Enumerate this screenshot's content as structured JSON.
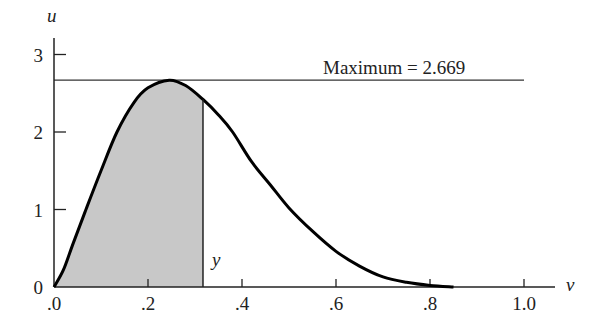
{
  "chart_data": {
    "type": "area",
    "title": "",
    "xlabel": "v",
    "ylabel": "u",
    "xlim": [
      0,
      1.06
    ],
    "ylim": [
      0,
      3.15
    ],
    "x_ticks": [
      0.0,
      0.2,
      0.4,
      0.6,
      0.8,
      1.0
    ],
    "x_tick_labels": [
      ".0",
      ".2",
      ".4",
      ".6",
      ".8",
      "1.0"
    ],
    "y_ticks": [
      0,
      1,
      2,
      3
    ],
    "y_tick_labels": [
      "0",
      "1",
      "2",
      "3"
    ],
    "grid": false,
    "legend": null,
    "series": [
      {
        "name": "density",
        "x": [
          0,
          0.02,
          0.04,
          0.068,
          0.1,
          0.134,
          0.17,
          0.2,
          0.245,
          0.28,
          0.317,
          0.35,
          0.38,
          0.42,
          0.46,
          0.5,
          0.55,
          0.6,
          0.65,
          0.7,
          0.75,
          0.8,
          0.85
        ],
        "y": [
          0,
          0.22,
          0.55,
          1.0,
          1.5,
          2.0,
          2.38,
          2.57,
          2.669,
          2.6,
          2.42,
          2.22,
          2.0,
          1.62,
          1.32,
          1.02,
          0.72,
          0.46,
          0.27,
          0.13,
          0.06,
          0.02,
          0.0
        ]
      }
    ],
    "shaded_region": {
      "from": 0.0,
      "to": 0.317,
      "label": "y"
    },
    "reference_line": {
      "y": 2.669,
      "x_from": 0.0,
      "x_to": 1.0,
      "label": "Maximum = 2.669"
    },
    "annotations": [
      {
        "text": "Maximum = 2.669",
        "x": 0.57,
        "y": 2.75
      },
      {
        "text": "y",
        "x": 0.345,
        "y": 0.3
      }
    ]
  },
  "labels": {
    "y_axis_var": "u",
    "x_axis_var": "v",
    "max_label": "Maximum = 2.669",
    "shade_label": "y",
    "x_ticks": [
      ".0",
      ".2",
      ".4",
      ".6",
      ".8",
      "1.0"
    ],
    "y_ticks": [
      "0",
      "1",
      "2",
      "3"
    ]
  },
  "colors": {
    "curve": "#000000",
    "shade": "#c8c8c8",
    "axis": "#222222"
  }
}
